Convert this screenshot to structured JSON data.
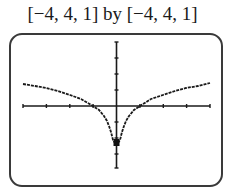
{
  "window": {
    "label": "[−4, 4, 1] by [−4, 4, 1]",
    "xmin": -4,
    "xmax": 4,
    "xscl": 1,
    "ymin": -4,
    "ymax": 4,
    "yscl": 1
  },
  "screen": {
    "frame_color": "#3a3a3a",
    "curve_color": "#1a1a1a",
    "axis_color": "#1a1a1a"
  },
  "graph": {
    "function": "y = ln|x|",
    "x_intercepts": [
      -1,
      1
    ],
    "approx_lowest_plotted_point": {
      "x": 0,
      "y": -2.3
    }
  }
}
